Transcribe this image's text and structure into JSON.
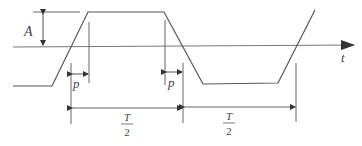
{
  "diagram": {
    "type": "trapezoidal-waveform",
    "labels": {
      "amplitude": "A",
      "time_axis": "t",
      "rise_time_left": "p",
      "rise_time_right": "p",
      "half_period_left_num": "T",
      "half_period_left_den": "2",
      "half_period_right_num": "T",
      "half_period_right_den": "2"
    },
    "colors": {
      "line": "#555555",
      "text": "#444444"
    }
  }
}
